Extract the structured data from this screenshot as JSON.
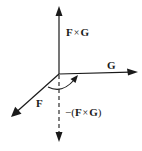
{
  "diagram": {
    "colors": {
      "stroke": "#1a1a1a",
      "background": "#ffffff"
    },
    "origin": {
      "x": 59,
      "y": 74
    },
    "vectors": [
      {
        "id": "fxg",
        "label": "F × G",
        "style": "solid",
        "from": [
          59,
          74
        ],
        "to": [
          59,
          7
        ]
      },
      {
        "id": "g",
        "label": "G",
        "style": "solid",
        "from": [
          59,
          74
        ],
        "to": [
          138,
          72
        ]
      },
      {
        "id": "f",
        "label": "F",
        "style": "solid",
        "from": [
          59,
          74
        ],
        "to": [
          11,
          117
        ]
      },
      {
        "id": "neg_fxg",
        "label": "−(F × G)",
        "style": "dashed",
        "from": [
          59,
          74
        ],
        "to": [
          59,
          142
        ]
      }
    ],
    "rotation_arrow": {
      "description": "curved arrow from F toward G",
      "direction": "counterclockwise-from-F-to-G"
    },
    "labels": {
      "fxg_left": "F",
      "fxg_op": "×",
      "fxg_right": "G",
      "g": "G",
      "f": "F",
      "neg_prefix": "−(",
      "neg_left": "F",
      "neg_op": "×",
      "neg_right": "G",
      "neg_suffix": ")"
    }
  }
}
